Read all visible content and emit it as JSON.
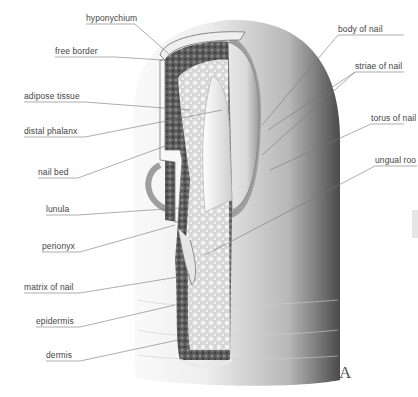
{
  "diagram": {
    "plate_letter": "A",
    "labels_left": [
      {
        "text": "hyponychium",
        "x": 86,
        "y": 13
      },
      {
        "text": "free border",
        "x": 55,
        "y": 46
      },
      {
        "text": "adipose tissue",
        "x": 24,
        "y": 91
      },
      {
        "text": "distal phalanx",
        "x": 24,
        "y": 126
      },
      {
        "text": "nail bed",
        "x": 38,
        "y": 167
      },
      {
        "text": "lunula",
        "x": 46,
        "y": 204
      },
      {
        "text": "perionyx",
        "x": 42,
        "y": 241
      },
      {
        "text": "matrix of nail",
        "x": 24,
        "y": 282
      },
      {
        "text": "epidermis",
        "x": 36,
        "y": 316
      },
      {
        "text": "dermis",
        "x": 46,
        "y": 350
      }
    ],
    "labels_right": [
      {
        "text": "body of nail",
        "x": 338,
        "y": 24
      },
      {
        "text": "striae of nail",
        "x": 355,
        "y": 61
      },
      {
        "text": "torus of nail",
        "x": 371,
        "y": 113
      },
      {
        "text": "ungual roo",
        "x": 375,
        "y": 155
      }
    ]
  }
}
